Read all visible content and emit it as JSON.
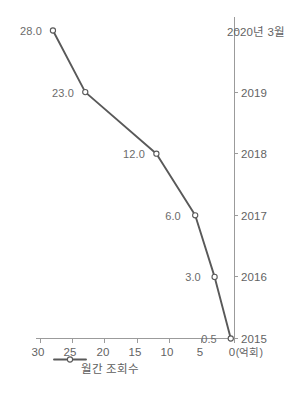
{
  "chart_data": {
    "type": "line",
    "title": "",
    "xlabel": "",
    "ylabel": "",
    "unit_label": "(억회)",
    "categories": [
      "2015",
      "2016",
      "2017",
      "2018",
      "2019",
      "2020년 3월"
    ],
    "series": [
      {
        "name": "월간 조회수",
        "values": [
          0.5,
          3.0,
          6.0,
          12.0,
          23.0,
          28.0
        ],
        "point_labels": [
          "0.5",
          "3.0",
          "6.0",
          "12.0",
          "23.0",
          "28.0"
        ],
        "line_color": "#595959",
        "marker": "open-circle"
      }
    ],
    "ylim": [
      0,
      30
    ],
    "yticks": [
      0,
      5,
      10,
      15,
      20,
      25,
      30
    ],
    "ytick_labels": [
      "0",
      "5",
      "10",
      "15",
      "20",
      "25",
      "30"
    ],
    "grid": false,
    "legend_position": "top-left",
    "orientation": "rotated-90-ccw"
  },
  "legend": {
    "entries": [
      {
        "label": "월간 조회수",
        "color": "#595959"
      }
    ]
  },
  "axes": {
    "value_axis_unit": "(억회)",
    "value_ticks": [
      "0",
      "5",
      "10",
      "15",
      "20",
      "25",
      "30"
    ],
    "category_ticks": [
      "2015",
      "2016",
      "2017",
      "2018",
      "2019",
      "2020년 3월"
    ]
  },
  "colors": {
    "line": "#595959",
    "axis": "#9b9b9b",
    "text": "#636363",
    "marker_fill": "#ffffff",
    "background": "#ffffff"
  }
}
